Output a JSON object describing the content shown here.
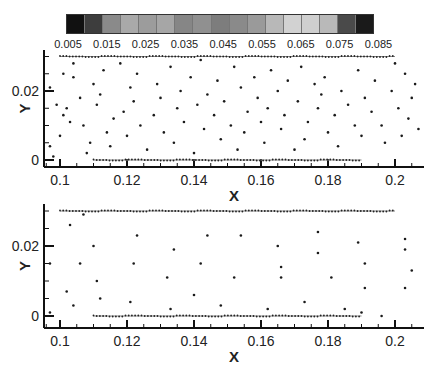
{
  "colorbar": {
    "colors": [
      "#111111",
      "#3d3d3d",
      "#8a8a8a",
      "#a9a9a9",
      "#9c9c9c",
      "#a6a6a6",
      "#868686",
      "#909090",
      "#7d7d7d",
      "#8a8a8a",
      "#9a9a9a",
      "#b8b8b8",
      "#d2d2d2",
      "#cfcfcf",
      "#b9b9b9",
      "#4a4a4a",
      "#1a1a1a"
    ],
    "labels": [
      "0.005",
      "0.015",
      "0.025",
      "0.035",
      "0.045",
      "0.055",
      "0.065",
      "0.075",
      "0.085"
    ]
  },
  "chart_data": [
    {
      "type": "scatter",
      "title": "",
      "xlabel": "X",
      "ylabel": "Y",
      "xlim": [
        0.096,
        0.208
      ],
      "ylim": [
        -0.002,
        0.032
      ],
      "xticks": [
        "0.1",
        "0.12",
        "0.14",
        "0.16",
        "0.18",
        "0.2"
      ],
      "yticks": [
        "0",
        "0.02"
      ],
      "lines": [
        {
          "name": "top-boundary",
          "x": [
            0.1,
            0.2
          ],
          "y": [
            0.03,
            0.03
          ]
        },
        {
          "name": "bottom-boundary",
          "x": [
            0.11,
            0.19
          ],
          "y": [
            0.0,
            0.0
          ]
        }
      ],
      "points": {
        "x": [
          0.097,
          0.099,
          0.101,
          0.103,
          0.104,
          0.097,
          0.1,
          0.102,
          0.098,
          0.101,
          0.104,
          0.106,
          0.107,
          0.109,
          0.11,
          0.108,
          0.111,
          0.113,
          0.114,
          0.116,
          0.112,
          0.115,
          0.118,
          0.119,
          0.121,
          0.12,
          0.122,
          0.124,
          0.123,
          0.126,
          0.128,
          0.129,
          0.13,
          0.131,
          0.133,
          0.135,
          0.134,
          0.136,
          0.137,
          0.139,
          0.14,
          0.141,
          0.143,
          0.142,
          0.144,
          0.146,
          0.148,
          0.147,
          0.149,
          0.151,
          0.152,
          0.153,
          0.154,
          0.156,
          0.155,
          0.158,
          0.159,
          0.16,
          0.161,
          0.163,
          0.162,
          0.165,
          0.166,
          0.167,
          0.168,
          0.17,
          0.171,
          0.172,
          0.174,
          0.173,
          0.176,
          0.177,
          0.178,
          0.18,
          0.179,
          0.182,
          0.183,
          0.184,
          0.186,
          0.188,
          0.189,
          0.19,
          0.191,
          0.193,
          0.194,
          0.196,
          0.197,
          0.199,
          0.2,
          0.201,
          0.202,
          0.203,
          0.204,
          0.205,
          0.206,
          0.207
        ],
        "y": [
          0.004,
          0.016,
          0.025,
          0.011,
          0.028,
          0.021,
          0.007,
          0.015,
          0.001,
          0.013,
          0.024,
          0.018,
          0.01,
          0.005,
          0.022,
          0.002,
          0.016,
          0.026,
          0.008,
          0.012,
          0.019,
          0.004,
          0.028,
          0.014,
          0.021,
          0.007,
          0.017,
          0.01,
          0.025,
          0.003,
          0.013,
          0.022,
          0.018,
          0.008,
          0.027,
          0.015,
          0.005,
          0.02,
          0.011,
          0.024,
          0.002,
          0.016,
          0.009,
          0.029,
          0.019,
          0.013,
          0.006,
          0.023,
          0.017,
          0.01,
          0.027,
          0.003,
          0.021,
          0.014,
          0.008,
          0.024,
          0.018,
          0.011,
          0.005,
          0.026,
          0.015,
          0.02,
          0.009,
          0.013,
          0.023,
          0.003,
          0.017,
          0.027,
          0.011,
          0.006,
          0.022,
          0.015,
          0.019,
          0.008,
          0.024,
          0.013,
          0.004,
          0.02,
          0.016,
          0.01,
          0.026,
          0.007,
          0.018,
          0.014,
          0.023,
          0.01,
          0.005,
          0.02,
          0.028,
          0.015,
          0.007,
          0.025,
          0.012,
          0.018,
          0.022,
          0.009
        ]
      }
    },
    {
      "type": "scatter",
      "title": "",
      "xlabel": "X",
      "ylabel": "Y",
      "xlim": [
        0.096,
        0.208
      ],
      "ylim": [
        -0.002,
        0.032
      ],
      "xticks": [
        "0.1",
        "0.12",
        "0.14",
        "0.16",
        "0.18",
        "0.2"
      ],
      "yticks": [
        "0",
        "0.02"
      ],
      "lines": [
        {
          "name": "top-boundary",
          "x": [
            0.1,
            0.2
          ],
          "y": [
            0.03,
            0.03
          ]
        },
        {
          "name": "bottom-boundary",
          "x": [
            0.11,
            0.19
          ],
          "y": [
            0.0,
            0.0
          ]
        }
      ],
      "points": {
        "x": [
          0.097,
          0.097,
          0.102,
          0.103,
          0.104,
          0.106,
          0.107,
          0.11,
          0.112,
          0.111,
          0.121,
          0.122,
          0.123,
          0.132,
          0.133,
          0.134,
          0.14,
          0.142,
          0.144,
          0.148,
          0.152,
          0.154,
          0.162,
          0.165,
          0.166,
          0.166,
          0.173,
          0.177,
          0.177,
          0.181,
          0.185,
          0.189,
          0.19,
          0.191,
          0.191,
          0.196,
          0.203,
          0.203,
          0.203,
          0.205
        ],
        "y": [
          0.001,
          0.015,
          0.007,
          0.026,
          0.003,
          0.015,
          0.029,
          0.02,
          0.005,
          0.01,
          0.004,
          0.015,
          0.023,
          0.011,
          0.002,
          0.019,
          0.006,
          0.015,
          0.023,
          0.003,
          0.011,
          0.023,
          0.002,
          0.02,
          0.011,
          0.014,
          0.004,
          0.024,
          0.018,
          0.011,
          0.002,
          0.021,
          0.001,
          0.015,
          0.008,
          0.0,
          0.022,
          0.019,
          0.008,
          0.013
        ]
      }
    }
  ]
}
